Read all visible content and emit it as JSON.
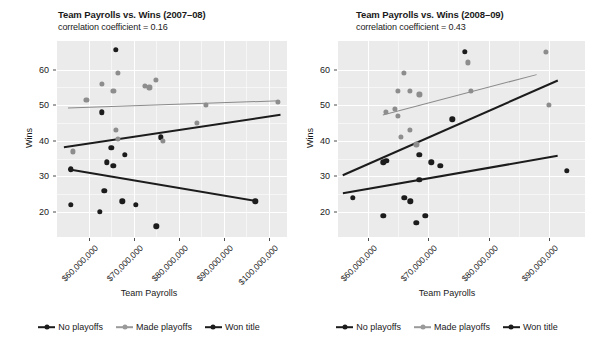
{
  "figure": {
    "width": 596,
    "height": 353,
    "background": "#ffffff",
    "panel_background": "#ebebeb",
    "grid_color": "#ffffff"
  },
  "colors": {
    "black": "#1c1c1c",
    "gray": "#8d8d8d",
    "trend_gray": "#8a8a8a",
    "axis_text": "#1a1a1a"
  },
  "legend": {
    "items": [
      {
        "label": "No playoffs",
        "color_key": "black",
        "marker": "line-with-point"
      },
      {
        "label": "Made playoffs",
        "color_key": "gray",
        "marker": "line-with-point"
      },
      {
        "label": "Won title",
        "color_key": "black",
        "marker": "line-with-point"
      }
    ]
  },
  "chart_data": [
    {
      "type": "scatter",
      "panel": "left",
      "title": "Team Payrolls vs. Wins (2007–08)",
      "subtitle": "correlation coefficient = 0.16",
      "correlation_coefficient": 0.16,
      "xlabel": "Team Payrolls",
      "ylabel": "Wins",
      "xlim": [
        53000000,
        104000000
      ],
      "ylim": [
        13,
        68
      ],
      "grid": true,
      "legend_position": "bottom",
      "xtick_labels": [
        "$60,000,000",
        "$70,000,000",
        "$80,000,000",
        "$90,000,000",
        "$100,000,000"
      ],
      "xtick_values": [
        60000000,
        70000000,
        80000000,
        90000000,
        100000000
      ],
      "ytick_labels": [
        "20",
        "30",
        "40",
        "50",
        "60"
      ],
      "ytick_values": [
        20,
        30,
        40,
        50,
        60
      ],
      "series": [
        {
          "name": "No playoffs",
          "color_key": "black",
          "points": [
            {
              "x": 56000000,
              "y": 32
            },
            {
              "x": 56000000,
              "y": 22
            },
            {
              "x": 63000000,
              "y": 48
            },
            {
              "x": 65000000,
              "y": 38
            },
            {
              "x": 64000000,
              "y": 34
            },
            {
              "x": 65500000,
              "y": 33
            },
            {
              "x": 63500000,
              "y": 26
            },
            {
              "x": 62500000,
              "y": 20
            },
            {
              "x": 68000000,
              "y": 36
            },
            {
              "x": 67500000,
              "y": 23
            },
            {
              "x": 66000000,
              "y": 65.5
            },
            {
              "x": 70500000,
              "y": 22
            },
            {
              "x": 75000000,
              "y": 16
            },
            {
              "x": 76000000,
              "y": 41
            },
            {
              "x": 97000000,
              "y": 23
            }
          ]
        },
        {
          "name": "Made playoffs",
          "color_key": "gray",
          "points": [
            {
              "x": 56500000,
              "y": 37
            },
            {
              "x": 59500000,
              "y": 51.5
            },
            {
              "x": 63000000,
              "y": 56
            },
            {
              "x": 66500000,
              "y": 59
            },
            {
              "x": 65500000,
              "y": 54
            },
            {
              "x": 66000000,
              "y": 43
            },
            {
              "x": 66500000,
              "y": 40.5
            },
            {
              "x": 72500000,
              "y": 55.5
            },
            {
              "x": 73500000,
              "y": 55
            },
            {
              "x": 75000000,
              "y": 57
            },
            {
              "x": 76500000,
              "y": 40
            },
            {
              "x": 84000000,
              "y": 45
            },
            {
              "x": 86000000,
              "y": 50
            },
            {
              "x": 102000000,
              "y": 51
            }
          ]
        }
      ],
      "trend_lines": [
        {
          "name": "Made playoffs fit",
          "color_key": "gray",
          "x0": 55500000,
          "y0": 49.2,
          "x1": 102500000,
          "y1": 51.2
        },
        {
          "name": "All teams fit",
          "color_key": "black",
          "x0": 54500000,
          "y0": 38.2,
          "x1": 102500000,
          "y1": 47.3
        },
        {
          "name": "No playoffs fit",
          "color_key": "black",
          "x0": 55500000,
          "y0": 32.0,
          "x1": 97500000,
          "y1": 23.0
        }
      ]
    },
    {
      "type": "scatter",
      "panel": "right",
      "title": "Team Payrolls vs. Wins (2008–09)",
      "subtitle": "correlation coefficient = 0.43",
      "correlation_coefficient": 0.43,
      "xlabel": "Team Payrolls",
      "ylabel": "Wins",
      "xlim": [
        55000000,
        96000000
      ],
      "ylim": [
        13,
        68
      ],
      "grid": true,
      "legend_position": "bottom",
      "xtick_labels": [
        "$60,000,000",
        "$70,000,000",
        "$80,000,000",
        "$90,000,000"
      ],
      "xtick_values": [
        60000000,
        70000000,
        80000000,
        90000000
      ],
      "ytick_labels": [
        "20",
        "30",
        "40",
        "50",
        "60"
      ],
      "ytick_values": [
        20,
        30,
        40,
        50,
        60
      ],
      "series": [
        {
          "name": "No playoffs",
          "color_key": "black",
          "points": [
            {
              "x": 57500000,
              "y": 24
            },
            {
              "x": 62500000,
              "y": 34
            },
            {
              "x": 63000000,
              "y": 34.3
            },
            {
              "x": 62500000,
              "y": 19
            },
            {
              "x": 66000000,
              "y": 24
            },
            {
              "x": 67000000,
              "y": 23
            },
            {
              "x": 68000000,
              "y": 17
            },
            {
              "x": 68500000,
              "y": 29
            },
            {
              "x": 69500000,
              "y": 19
            },
            {
              "x": 68500000,
              "y": 36
            },
            {
              "x": 70500000,
              "y": 34
            },
            {
              "x": 72000000,
              "y": 33
            },
            {
              "x": 74000000,
              "y": 46
            },
            {
              "x": 76000000,
              "y": 65
            },
            {
              "x": 93000000,
              "y": 31.5
            }
          ]
        },
        {
          "name": "Made playoffs",
          "color_key": "gray",
          "points": [
            {
              "x": 63000000,
              "y": 48
            },
            {
              "x": 64500000,
              "y": 49
            },
            {
              "x": 65000000,
              "y": 47
            },
            {
              "x": 65000000,
              "y": 54
            },
            {
              "x": 66000000,
              "y": 59
            },
            {
              "x": 67000000,
              "y": 54
            },
            {
              "x": 65500000,
              "y": 41
            },
            {
              "x": 67000000,
              "y": 43
            },
            {
              "x": 68500000,
              "y": 53
            },
            {
              "x": 68000000,
              "y": 39
            },
            {
              "x": 77000000,
              "y": 54
            },
            {
              "x": 76500000,
              "y": 62
            },
            {
              "x": 89500000,
              "y": 65
            },
            {
              "x": 90000000,
              "y": 50
            }
          ]
        }
      ],
      "trend_lines": [
        {
          "name": "Made playoffs fit",
          "color_key": "gray",
          "x0": 62500000,
          "y0": 47.3,
          "x1": 88000000,
          "y1": 58.6
        },
        {
          "name": "All teams fit",
          "color_key": "black",
          "x0": 55800000,
          "y0": 30.4,
          "x1": 91500000,
          "y1": 57.0
        },
        {
          "name": "No playoffs fit",
          "color_key": "black",
          "x0": 55800000,
          "y0": 25.3,
          "x1": 91500000,
          "y1": 35.8
        }
      ]
    }
  ]
}
